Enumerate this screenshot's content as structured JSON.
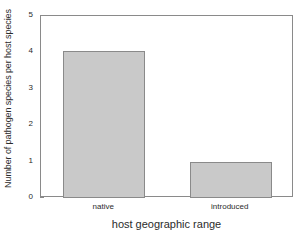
{
  "chart_data": {
    "type": "bar",
    "title": "",
    "xlabel": "host geographic range",
    "ylabel": "Number of pathogen species per host species",
    "categories": [
      "native",
      "introduced"
    ],
    "values": [
      4.05,
      1.0
    ],
    "ylim": [
      0,
      5
    ],
    "yticks": [
      0,
      1,
      2,
      3,
      4,
      5
    ],
    "ytick_labels": [
      "0",
      "1",
      "2",
      "3",
      "4",
      "5"
    ],
    "grid": false,
    "legend": false,
    "legend_position": "none",
    "bar_fill_color": "#c9c9c9",
    "bar_edge_color": "#8a8a8a",
    "frame_color": "#8a8a8a",
    "background_color": "#ffffff"
  }
}
